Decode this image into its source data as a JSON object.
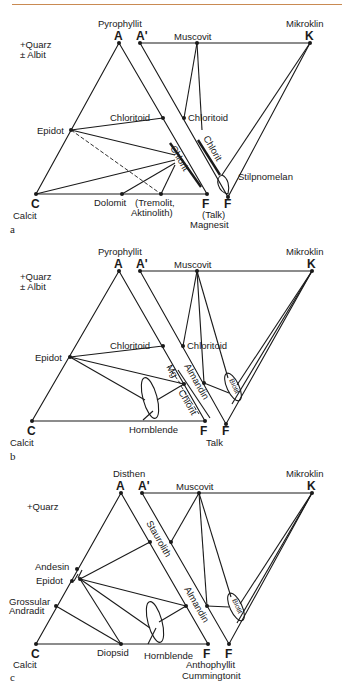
{
  "header_rule_color": "#c98a52",
  "diagrams": [
    {
      "panel": "a",
      "assemblage": [
        "+Quarz",
        "± Albit"
      ],
      "vertices": {
        "A": "A",
        "A_prime": "A'",
        "K": "K",
        "C": "C",
        "F": "F",
        "F_prime": "F"
      },
      "minerals": {
        "top_left": "Pyrophyllit",
        "top_right": "Mikroklin",
        "muscovit": "Muscovit",
        "calcit": "Calcit",
        "epidot": "Epidot",
        "chloritoid_left": "Chloritoid",
        "chloritoid_right": "Chloritoid",
        "chlorit_left": "Chlorit",
        "chlorit_right": "Chlorit",
        "stilpnomelan": "Stilpnomelan",
        "dolomit": "Dolomit",
        "tremolit_1": "(Tremolit,",
        "tremolit_2": "Aktinolith)",
        "talk": "(Talk)",
        "magnesit": "Magnesit"
      }
    },
    {
      "panel": "b",
      "assemblage": [
        "+Quarz",
        "± Albit"
      ],
      "vertices": {
        "A": "A",
        "A_prime": "A'",
        "K": "K",
        "C": "C",
        "F": "F",
        "F_prime": "F"
      },
      "minerals": {
        "top_left": "Pyrophyllit",
        "top_right": "Mikroklin",
        "muscovit": "Muscovit",
        "calcit": "Calcit",
        "epidot": "Epidot",
        "chloritoid_left": "Chloritoid",
        "chloritoid_right": "Chloritoid",
        "mg": "Mg",
        "chlorit": "Chlorit",
        "almandin": "Almandin",
        "biotit": "Biotit",
        "hornblende": "Hornblende",
        "talk": "Talk"
      }
    },
    {
      "panel": "c",
      "assemblage": [
        "+Quarz"
      ],
      "vertices": {
        "A": "A",
        "A_prime": "A'",
        "K": "K",
        "C": "C",
        "F": "F",
        "F_prime": "F"
      },
      "minerals": {
        "top_left": "Disthen",
        "top_right": "Mikroklin",
        "muscovit": "Muscovit",
        "calcit": "Calcit",
        "andesin": "Andesin",
        "epidot": "Epidot",
        "grossular": "Grossular",
        "andradit": "Andradit",
        "staurolith": "Staurolith",
        "almandin": "Almandin",
        "biotit": "Biotit",
        "diopsid": "Diopsid",
        "hornblende": "Hornblende",
        "anthophyllit": "Anthophyllit",
        "cummingtonit": "Cummingtonit"
      }
    }
  ]
}
